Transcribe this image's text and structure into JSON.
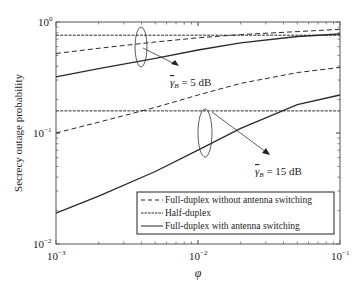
{
  "chart_data": {
    "type": "line",
    "title": "",
    "xlabel": "φ",
    "ylabel": "Secrecy outage probability",
    "xscale": "log",
    "yscale": "log",
    "xlim": [
      0.001,
      0.1
    ],
    "ylim": [
      0.01,
      1
    ],
    "xticks": [
      {
        "base": "10",
        "exp": "−3",
        "value": 0.001
      },
      {
        "base": "10",
        "exp": "−2",
        "value": 0.01
      },
      {
        "base": "10",
        "exp": "−1",
        "value": 0.1
      }
    ],
    "yticks": [
      {
        "base": "10",
        "exp": "0",
        "value": 1
      },
      {
        "base": "10",
        "exp": "−1",
        "value": 0.1
      },
      {
        "base": "10",
        "exp": "−2",
        "value": 0.01
      }
    ],
    "grid": false,
    "legend_position": "lower right",
    "x": [
      0.001,
      0.002,
      0.005,
      0.01,
      0.02,
      0.05,
      0.1
    ],
    "series": [
      {
        "name": "Full-duplex without antenna switching",
        "group": "γB = 5 dB",
        "style": "dashed",
        "values": [
          0.52,
          0.58,
          0.66,
          0.72,
          0.77,
          0.82,
          0.86
        ]
      },
      {
        "name": "Half-duplex",
        "group": "γB = 5 dB",
        "style": "dashdot",
        "values": [
          0.76,
          0.76,
          0.76,
          0.76,
          0.76,
          0.76,
          0.76
        ]
      },
      {
        "name": "Full-duplex with antenna switching",
        "group": "γB = 5 dB",
        "style": "solid",
        "values": [
          0.32,
          0.38,
          0.47,
          0.56,
          0.65,
          0.74,
          0.78
        ]
      },
      {
        "name": "Full-duplex without antenna switching",
        "group": "γB = 15 dB",
        "style": "dashed",
        "values": [
          0.1,
          0.125,
          0.17,
          0.22,
          0.28,
          0.35,
          0.39
        ]
      },
      {
        "name": "Half-duplex",
        "group": "γB = 15 dB",
        "style": "dashdot",
        "values": [
          0.158,
          0.158,
          0.158,
          0.158,
          0.158,
          0.158,
          0.158
        ]
      },
      {
        "name": "Full-duplex with antenna switching",
        "group": "γB = 15 dB",
        "style": "solid",
        "values": [
          0.019,
          0.027,
          0.045,
          0.07,
          0.11,
          0.18,
          0.22
        ]
      }
    ],
    "legend": [
      {
        "label": "Full-duplex without antenna switching",
        "style": "dashed"
      },
      {
        "label": "Half-duplex",
        "style": "dashdot"
      },
      {
        "label": "Full-duplex with antenna switching",
        "style": "solid"
      }
    ],
    "annotations": [
      {
        "text_symbol": "γ",
        "text_sub": "B",
        "text_rest": " = 5 dB",
        "ellipse_at_phi": 0.004
      },
      {
        "text_symbol": "γ",
        "text_sub": "B",
        "text_rest": " = 15 dB",
        "ellipse_at_phi": 0.011
      }
    ],
    "colors": {
      "line": "#2a2a2a",
      "axes": "#444444",
      "background": "#ffffff"
    }
  }
}
